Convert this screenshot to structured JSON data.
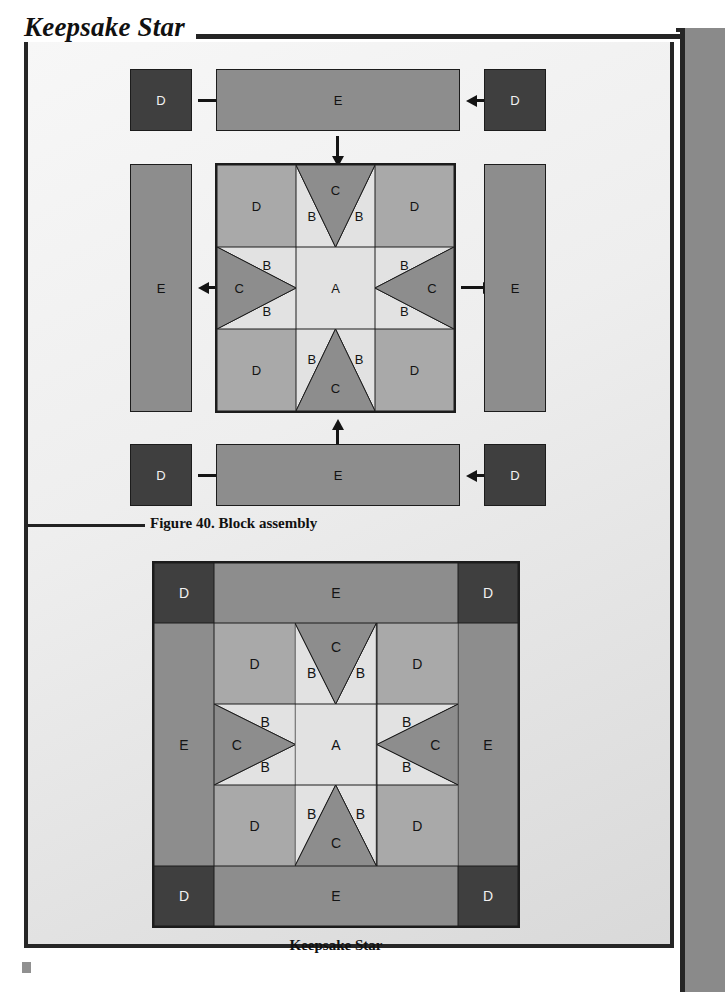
{
  "page": {
    "title": "Keepsake Star"
  },
  "figure": {
    "caption_number": "Figure 40.",
    "caption_text": "Block assembly",
    "caption_full": "Figure 40. Block assembly"
  },
  "finished_block": {
    "caption": "Keepsake Star"
  },
  "colors": {
    "fabric_a": "#e2e2e2",
    "fabric_b": "#e2e2e2",
    "fabric_c": "#8d8d8d",
    "fabric_d_block": "#a9a9a9",
    "fabric_d_corner": "#3f3f3f",
    "fabric_e": "#8d8d8d",
    "outline": "#1c1c1c",
    "page_background": "#eeeeee",
    "side_bar": "#8a8a8a"
  },
  "assembly": {
    "pieces": {
      "a": "A",
      "b": "B",
      "c": "C",
      "d": "D",
      "e": "E"
    },
    "top_row": {
      "left_square": "D",
      "strip": "E",
      "right_square": "D"
    },
    "middle_row": {
      "left_strip": "E",
      "right_strip": "E"
    },
    "bottom_row": {
      "left_square": "D",
      "strip": "E",
      "right_square": "D"
    },
    "arrows": [
      {
        "name": "arrow-top-left",
        "direction": "right"
      },
      {
        "name": "arrow-top-right",
        "direction": "left"
      },
      {
        "name": "arrow-top-strip-down",
        "direction": "down"
      },
      {
        "name": "arrow-left-strip",
        "direction": "left"
      },
      {
        "name": "arrow-right-strip",
        "direction": "right"
      },
      {
        "name": "arrow-bottom-left",
        "direction": "right"
      },
      {
        "name": "arrow-bottom-right",
        "direction": "left"
      },
      {
        "name": "arrow-bottom-strip-up",
        "direction": "up"
      }
    ]
  },
  "star_block": {
    "grid": [
      [
        "D",
        "flying-geese-up",
        "D"
      ],
      [
        "flying-geese-left",
        "A",
        "flying-geese-right"
      ],
      [
        "D",
        "flying-geese-down",
        "D"
      ]
    ],
    "labels": {
      "center": "A",
      "wing": "B",
      "point": "C",
      "corner": "D"
    }
  },
  "finished_layout": {
    "corners": [
      "D",
      "D",
      "D",
      "D"
    ],
    "borders": [
      "E",
      "E",
      "E",
      "E"
    ]
  }
}
